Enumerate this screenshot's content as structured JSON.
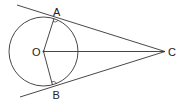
{
  "diagram": {
    "labels": {
      "A": "A",
      "B": "B",
      "O": "O",
      "C": "C"
    },
    "stroke_color": "#333333",
    "elements": [
      "circle centre O",
      "tangent CA",
      "tangent CB",
      "radius OA",
      "radius OB",
      "segment OC",
      "right angle at A",
      "right angle at B"
    ]
  }
}
